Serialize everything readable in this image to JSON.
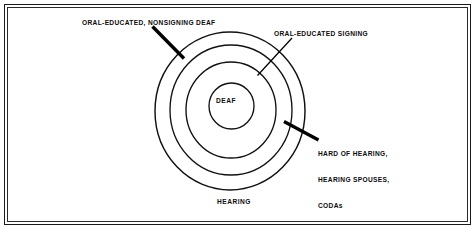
{
  "figure": {
    "type": "concentric-circles-venn",
    "background_color": "#ffffff",
    "line_color": "#111111",
    "text_color": "#0c0c0c",
    "frame": {
      "style": "double-rule-border"
    },
    "rings": [
      {
        "name": "hearing",
        "order": 4,
        "label": "HEARING"
      },
      {
        "name": "hard-of-hearing",
        "order": 3,
        "label": ""
      },
      {
        "name": "oral-educated-signing",
        "order": 2,
        "label": ""
      },
      {
        "name": "deaf",
        "order": 1,
        "label": "DEAF"
      }
    ],
    "labels": {
      "deaf": "DEAF",
      "hearing": "HEARING",
      "oral_nonsigning": "ORAL-EDUCATED, NONSIGNING DEAF",
      "oral_signing": "ORAL-EDUCATED SIGNING",
      "hard_of_hearing_line1": "HARD OF HEARING,",
      "hard_of_hearing_line2": "HEARING SPOUSES,",
      "hard_of_hearing_line3": "CODAs"
    }
  }
}
